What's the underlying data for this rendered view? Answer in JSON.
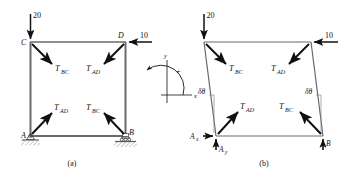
{
  "figure": {
    "stroke_color": "#111111",
    "member_color": "#555555",
    "ground_color": "#999999"
  },
  "panel_a": {
    "caption": "(a)",
    "joints": {
      "C": "C",
      "D": "D",
      "A": "A",
      "B": "B"
    },
    "loads": {
      "vertical_at_C": "20",
      "horizontal_at_D": "10"
    },
    "cable_forces": {
      "at_C": "T",
      "at_C_sub": "BC",
      "at_D": "T",
      "at_D_sub": "AD",
      "at_A": "T",
      "at_A_sub": "AD",
      "at_B": "T",
      "at_B_sub": "BC"
    },
    "supports": {
      "A_type": "pin-support",
      "B_type": "roller-support"
    }
  },
  "axes": {
    "x_label": "x",
    "y_label": "y",
    "sign_label": "+",
    "rotation_sense": "counterclockwise-positive"
  },
  "panel_b": {
    "caption": "(b)",
    "loads": {
      "vertical_top_left": "20",
      "horizontal_top_right": "10"
    },
    "cable_forces": {
      "upper_left": "T",
      "upper_left_sub": "BC",
      "upper_right": "T",
      "upper_right_sub": "AD",
      "lower_left": "T",
      "lower_left_sub": "AD",
      "lower_right": "T",
      "lower_right_sub": "BC"
    },
    "virtual_angle_left": "δθ",
    "virtual_angle_right": "δθ",
    "reactions": {
      "Ax": "A",
      "Ax_sub": "x",
      "Ay": "A",
      "Ay_sub": "y",
      "B": "B"
    }
  }
}
